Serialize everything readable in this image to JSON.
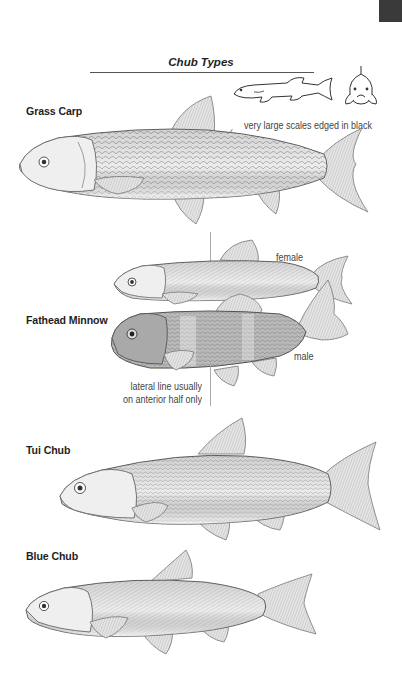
{
  "page": {
    "title": "Chub Types"
  },
  "species": [
    {
      "name": "Grass Carp",
      "annotations": [
        "very large scales edged in black"
      ]
    },
    {
      "name": "Fathead Minnow",
      "annotations": [
        "female",
        "male",
        "lateral line usually",
        "on anterior half only"
      ]
    },
    {
      "name": "Tui Chub",
      "annotations": []
    },
    {
      "name": "Blue Chub",
      "annotations": []
    }
  ],
  "illustrations": {
    "grass_carp": "grass-carp-illustration",
    "grass_carp_outline_side": "grass-carp-outline-side-view",
    "grass_carp_outline_front": "grass-carp-outline-front-view",
    "fathead_female": "fathead-minnow-female-illustration",
    "fathead_male": "fathead-minnow-male-illustration",
    "tui_chub": "tui-chub-illustration",
    "blue_chub": "blue-chub-illustration"
  },
  "colors": {
    "thumb_tab": "#3a3a3a",
    "text": "#1e1e1e",
    "fish_fill": "#e9e9e9",
    "fish_stroke": "#666666"
  }
}
